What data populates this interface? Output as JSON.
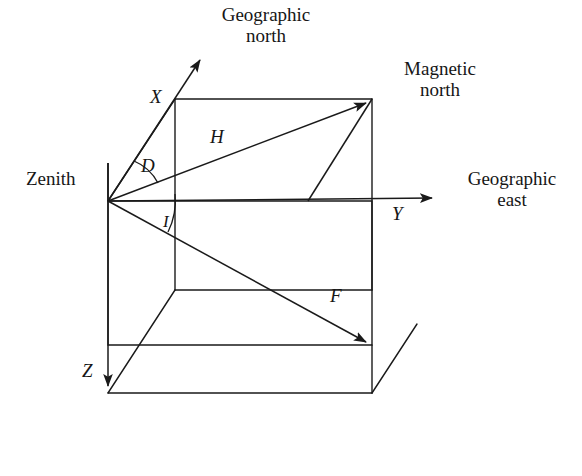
{
  "figure": {
    "type": "vector-diagram",
    "background_color": "#ffffff",
    "line_color": "#1a1a1a",
    "stroke_width": 1.4
  },
  "labels": {
    "zenith": "Zenith",
    "geographic_north": "Geographic\nnorth",
    "magnetic_north": "Magnetic\nnorth",
    "geographic_east": "Geographic\neast",
    "axis_x": "X",
    "axis_y": "Y",
    "axis_z": "Z",
    "component_h": "H",
    "component_f": "F",
    "angle_d": "D",
    "angle_i": "I"
  },
  "geometry": {
    "origin": [
      108,
      201
    ],
    "box_front": [
      [
        108,
        201
      ],
      [
        372,
        201
      ],
      [
        372,
        345
      ],
      [
        108,
        345
      ]
    ],
    "box_back_offset": [
      67,
      -102
    ],
    "north_arrow_tip": [
      205,
      50
    ],
    "east_arrow_tip": [
      440,
      198
    ],
    "down_arrow_tip": [
      108,
      393
    ],
    "h_arrow_tip": [
      372,
      99
    ],
    "f_arrow_tip": [
      372,
      345
    ],
    "zenith_tick_top": [
      108,
      163
    ]
  },
  "arcs": {
    "declination_angle_label": "D",
    "inclination_angle_label": "I"
  }
}
